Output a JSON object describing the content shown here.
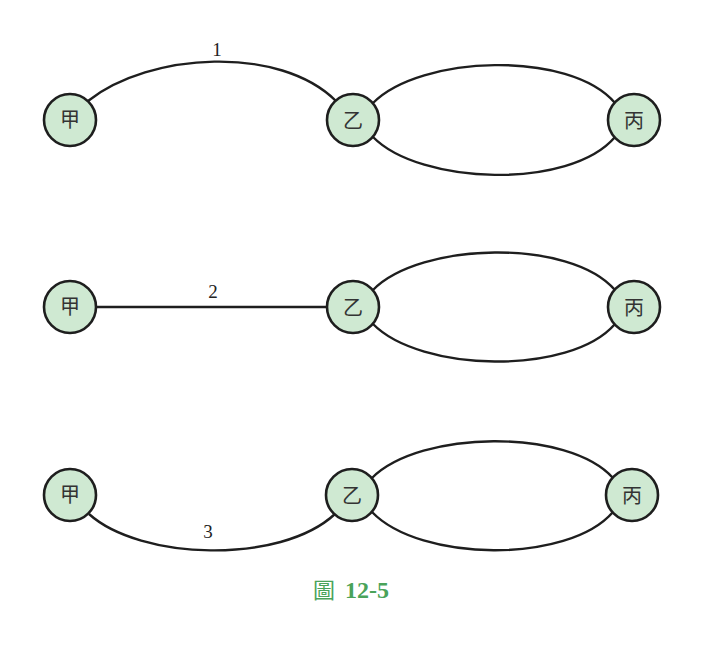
{
  "diagram": {
    "rows": [
      {
        "nodes": [
          {
            "label": "甲",
            "x": 70,
            "y": 120
          },
          {
            "label": "乙",
            "x": 353,
            "y": 120
          },
          {
            "label": "丙",
            "x": 634,
            "y": 120
          }
        ],
        "edge_label": "1",
        "path_type": "arc-up"
      },
      {
        "nodes": [
          {
            "label": "甲",
            "x": 70,
            "y": 307
          },
          {
            "label": "乙",
            "x": 353,
            "y": 307
          },
          {
            "label": "丙",
            "x": 634,
            "y": 307
          }
        ],
        "edge_label": "2",
        "path_type": "straight"
      },
      {
        "nodes": [
          {
            "label": "甲",
            "x": 70,
            "y": 495
          },
          {
            "label": "乙",
            "x": 352,
            "y": 495
          },
          {
            "label": "丙",
            "x": 632,
            "y": 495
          }
        ],
        "edge_label": "3",
        "path_type": "arc-down"
      }
    ],
    "caption": {
      "prefix": "圖",
      "number": "12-5"
    },
    "colors": {
      "node_fill": "#cfe9d2",
      "stroke": "#1e1e1e",
      "caption": "#4aa35a"
    }
  }
}
